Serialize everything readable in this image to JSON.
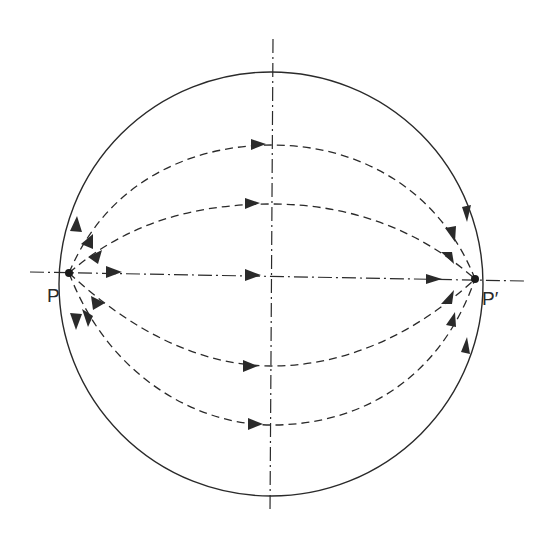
{
  "diagram": {
    "type": "field-lines-between-two-points-on-sphere",
    "colors": {
      "stroke": "#2a2a2a",
      "background": "#ffffff"
    },
    "points": [
      {
        "id": "P",
        "label": "P",
        "x": 69,
        "y": 273
      },
      {
        "id": "P_prime",
        "label": "P′",
        "x": 475,
        "y": 279
      }
    ],
    "circle": {
      "cx": 271,
      "cy": 284,
      "r": 212,
      "style": "solid"
    },
    "axes": {
      "horizontal": {
        "x1": 30,
        "y1": 272,
        "x2": 525,
        "y2": 281,
        "style": "dash-dot"
      },
      "vertical": {
        "x1": 273,
        "y1": 39,
        "x2": 270,
        "y2": 513,
        "style": "dash-dot"
      }
    },
    "curves": [
      {
        "id": "upper-outer",
        "style": "dashed",
        "apex_y": 145
      },
      {
        "id": "upper-inner",
        "style": "dashed",
        "apex_y": 204
      },
      {
        "id": "center",
        "style": "dash-dot",
        "apex_y": 276
      },
      {
        "id": "lower-inner",
        "style": "dashed",
        "apex_y": 366
      },
      {
        "id": "lower-outer",
        "style": "dashed",
        "apex_y": 425
      }
    ],
    "arrow_direction": "P to P′"
  }
}
